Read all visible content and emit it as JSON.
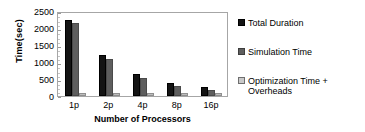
{
  "chart_data": {
    "type": "bar",
    "title": "",
    "xlabel": "Number of Processors",
    "ylabel": "Time(sec)",
    "categories": [
      "1p",
      "2p",
      "4p",
      "8p",
      "16p"
    ],
    "series": [
      {
        "name": "Total Duration",
        "color": "#141414",
        "values": [
          2250,
          1200,
          650,
          380,
          260
        ]
      },
      {
        "name": "Simulation Time",
        "color": "#5e5e5e",
        "values": [
          2150,
          1100,
          540,
          290,
          175
        ]
      },
      {
        "name": "Optimization Time + Overheads",
        "color": "#bdbdbd",
        "values": [
          80,
          90,
          85,
          80,
          80
        ]
      }
    ],
    "ylim": [
      0,
      2500
    ],
    "yticks": [
      0,
      500,
      1000,
      1500,
      2000,
      2500
    ],
    "ytick_labels": [
      "0",
      "500",
      "1000",
      "1500",
      "2000",
      "2500"
    ],
    "grid": false,
    "legend_position": "right"
  },
  "legend": {
    "entries": [
      {
        "label": "Total Duration"
      },
      {
        "label": "Simulation Time"
      },
      {
        "label": "Optimization Time + Overheads"
      }
    ]
  }
}
